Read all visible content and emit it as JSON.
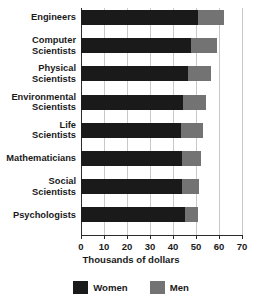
{
  "chart_data": {
    "type": "bar",
    "orientation": "horizontal",
    "stacked": true,
    "title": "",
    "xlabel": "Thousands of dollars",
    "ylabel": "",
    "xlim": [
      0,
      70
    ],
    "xticks": [
      0,
      10,
      20,
      30,
      40,
      50,
      60,
      70
    ],
    "xtick_labels": [
      "0",
      "10",
      "20",
      "30",
      "40",
      "50",
      "60",
      "70"
    ],
    "grid": true,
    "grid_axis": "x",
    "legend_position": "bottom",
    "categories": [
      "Engineers",
      "Computer\nScientists",
      "Physical\nScientists",
      "Environmental\nScientists",
      "Life\nScientists",
      "Mathematicians",
      "Social\nScientists",
      "Psychologists"
    ],
    "series": [
      {
        "name": "Women",
        "color": "#1a1a1a",
        "values": [
          51,
          48,
          46.5,
          44.5,
          43.5,
          44,
          44,
          45
        ]
      },
      {
        "name": "Men",
        "color": "#737373",
        "values": [
          11,
          11,
          10,
          10,
          9.5,
          8,
          7.5,
          6
        ]
      }
    ],
    "totals": [
      62,
      59,
      56.5,
      54.5,
      53,
      52,
      51.5,
      51
    ]
  },
  "legend": {
    "items": [
      {
        "label": "Women",
        "color": "#1a1a1a",
        "swatch": "legend-swatch-women"
      },
      {
        "label": "Men",
        "color": "#737373",
        "swatch": "legend-swatch-men"
      }
    ]
  },
  "axis": {
    "title": "Thousands of dollars"
  },
  "colors": {
    "women": "#1a1a1a",
    "men": "#737373",
    "gridline": "#c9c9c9",
    "axis": "#2b2b2b",
    "text": "#1a1a1a",
    "background": "#ffffff"
  }
}
